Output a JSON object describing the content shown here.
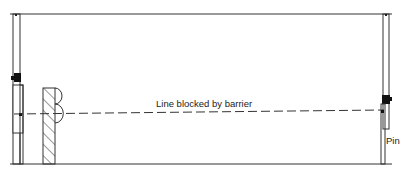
{
  "diagram": {
    "annotation": "Line blocked by barrier",
    "pin_label": "Pin",
    "colors": {
      "line": "#333333",
      "background": "#ffffff"
    }
  }
}
